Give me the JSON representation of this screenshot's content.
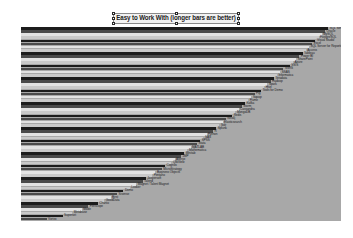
{
  "title": {
    "text": "Easy to Work With (longer bars are better)",
    "selected": true
  },
  "colors": {
    "page_background": "#ffffff",
    "plot_background": "#a8a8a8",
    "bar_dark": "#1c1c1c",
    "bar_mid": "#4a4a4a",
    "bar_light": "#e2e2e2",
    "bar_pale": "#c9c9c9",
    "title_box_fill": "#f2f2f2",
    "title_box_border": "#8a8a8a",
    "label_text": "#20201f"
  },
  "chart_data": {
    "type": "bar",
    "orientation": "horizontal",
    "title": "Easy to Work With (longer bars are better)",
    "xlabel": "",
    "ylabel": "",
    "grid": false,
    "legend_position": "none",
    "axis_visible": false,
    "xlim": [
      0,
      100
    ],
    "sorted": "descending",
    "note": "Labels are rendered at the end of each bar; source image resolution renders most label text illegible.",
    "categories": [
      "SQL Server 2014",
      "Oracle",
      "MySQL",
      "PostgreSQL",
      "Visual Studio",
      "Excel",
      "SQL Server for Reporting",
      "Access",
      "Tableau",
      "Power BI",
      "SharePoint",
      "Azure",
      "SSIS",
      "SSRS",
      "SSAS",
      "Informatica",
      "Teradata",
      "Hadoop",
      "Spark",
      "Hive",
      "Tools for Demo",
      "Pig",
      "Sqoop",
      "Flume",
      "Kafka",
      "Storm",
      "Cassandra",
      "MongoDB",
      "Redis",
      "Neo4j",
      "Elasticsearch",
      "Solr",
      "Splunk",
      "R",
      "Python",
      "SAS",
      "SPSS",
      "Stata",
      "MATLAB",
      "Mathematica",
      "Minitab",
      "JMP",
      "Alteryx",
      "QlikView",
      "Cognos",
      "MicroStrategy",
      "Business Objects",
      "Pentaho",
      "Jaspersoft",
      "Talend",
      "Magnet / Talent Magnet",
      "Looker",
      "Domo",
      "Sisense",
      "Birst",
      "GoodData",
      "Chartio",
      "Periscope",
      "Mode",
      "Metabase",
      "Superset",
      "Vortex"
    ],
    "values": [
      96,
      95,
      94,
      93,
      92,
      91,
      90,
      89,
      88,
      87,
      86,
      85,
      84,
      82,
      81,
      80,
      79,
      78,
      77,
      76,
      75,
      73,
      72,
      71,
      70,
      69,
      68,
      67,
      66,
      64,
      63,
      62,
      61,
      60,
      58,
      57,
      56,
      55,
      53,
      52,
      51,
      50,
      48,
      47,
      45,
      44,
      42,
      41,
      39,
      38,
      36,
      34,
      32,
      30,
      28,
      26,
      24,
      21,
      19,
      16,
      13,
      8
    ]
  }
}
